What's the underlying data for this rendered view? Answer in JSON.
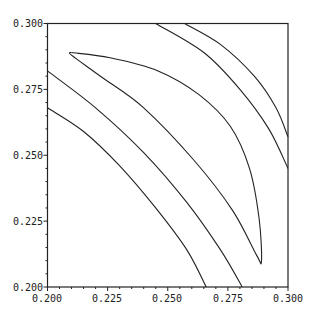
{
  "chart_data": {
    "type": "contour",
    "title": "",
    "xlabel": "",
    "ylabel": "",
    "xlim": [
      0.2,
      0.3
    ],
    "ylim": [
      0.2,
      0.3
    ],
    "grid": false,
    "legend": null,
    "x_ticks": [
      "0.200",
      "0.225",
      "0.250",
      "0.275",
      "0.300"
    ],
    "y_ticks": [
      "0.300",
      "0.275",
      "0.250",
      "0.225",
      "0.200"
    ],
    "contours": [
      {
        "name": "contour-1",
        "closed": false,
        "points": [
          [
            0.2,
            0.268
          ],
          [
            0.215,
            0.259
          ],
          [
            0.23,
            0.246
          ],
          [
            0.245,
            0.23
          ],
          [
            0.258,
            0.214
          ],
          [
            0.266,
            0.2
          ]
        ]
      },
      {
        "name": "contour-2",
        "closed": false,
        "points": [
          [
            0.2,
            0.282
          ],
          [
            0.22,
            0.268
          ],
          [
            0.24,
            0.251
          ],
          [
            0.258,
            0.232
          ],
          [
            0.272,
            0.214
          ],
          [
            0.281,
            0.2
          ]
        ]
      },
      {
        "name": "contour-3",
        "closed": true,
        "points": [
          [
            0.21,
            0.289
          ],
          [
            0.226,
            0.287
          ],
          [
            0.246,
            0.282
          ],
          [
            0.263,
            0.273
          ],
          [
            0.276,
            0.261
          ],
          [
            0.284,
            0.245
          ],
          [
            0.288,
            0.226
          ],
          [
            0.289,
            0.21
          ],
          [
            0.287,
            0.212
          ],
          [
            0.277,
            0.229
          ],
          [
            0.261,
            0.248
          ],
          [
            0.24,
            0.268
          ],
          [
            0.222,
            0.28
          ],
          [
            0.21,
            0.288
          ]
        ]
      },
      {
        "name": "contour-4",
        "closed": false,
        "points": [
          [
            0.245,
            0.3
          ],
          [
            0.265,
            0.289
          ],
          [
            0.28,
            0.275
          ],
          [
            0.292,
            0.26
          ],
          [
            0.3,
            0.245
          ]
        ]
      },
      {
        "name": "contour-5",
        "closed": false,
        "points": [
          [
            0.257,
            0.3
          ],
          [
            0.272,
            0.292
          ],
          [
            0.286,
            0.28
          ],
          [
            0.295,
            0.268
          ],
          [
            0.3,
            0.257
          ]
        ]
      }
    ]
  }
}
